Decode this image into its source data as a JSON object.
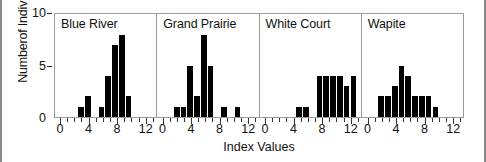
{
  "chart_data": {
    "type": "bar",
    "title": "",
    "xlabel": "Index Values",
    "ylabel": "Numberof Individuals",
    "ylim": [
      0,
      10
    ],
    "xlim": [
      0,
      13.5
    ],
    "yticks": [
      0,
      5,
      10
    ],
    "ytick_labels": [
      "0",
      "5",
      "10"
    ],
    "xticks": [
      0,
      1,
      2,
      3,
      4,
      5,
      6,
      7,
      8,
      9,
      10,
      11,
      12,
      13
    ],
    "xtick_labels": [
      "0",
      "",
      "",
      "",
      "4",
      "",
      "",
      "",
      "8",
      "",
      "",
      "",
      "12",
      ""
    ],
    "xtick_major": [
      0,
      4,
      8,
      12
    ],
    "grid": false,
    "legend": "none",
    "bar_color": "#000000",
    "panels": [
      {
        "name": "Blue River",
        "x": [
          1,
          2,
          3,
          4,
          5,
          6,
          7,
          8,
          9,
          10,
          11,
          12
        ],
        "values": [
          0,
          0,
          1,
          2,
          0,
          1,
          4,
          7,
          8,
          2,
          0,
          0
        ]
      },
      {
        "name": "Grand Prairie",
        "x": [
          1,
          2,
          3,
          4,
          5,
          6,
          7,
          8,
          9,
          10,
          11,
          12
        ],
        "values": [
          0,
          1,
          1,
          5,
          2,
          8,
          5,
          0,
          1,
          0,
          1,
          0
        ]
      },
      {
        "name": "White Court",
        "x": [
          1,
          2,
          3,
          4,
          5,
          6,
          7,
          8,
          9,
          10,
          11,
          12,
          13
        ],
        "values": [
          0,
          0,
          0,
          0,
          1,
          1,
          0,
          4,
          4,
          4,
          4,
          3,
          4
        ]
      },
      {
        "name": "Wapite",
        "x": [
          1,
          2,
          3,
          4,
          5,
          6,
          7,
          8,
          9,
          10,
          11,
          12
        ],
        "values": [
          0,
          2,
          2,
          3,
          5,
          4,
          2,
          2,
          2,
          1,
          0,
          0
        ]
      }
    ]
  }
}
